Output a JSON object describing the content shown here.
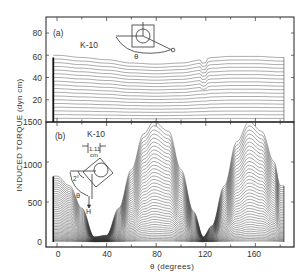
{
  "chart_data": [
    {
      "panel": "(a)",
      "type": "line",
      "sample": "K-10",
      "title": "",
      "xlabel": "θ (degrees)",
      "ylabel": "INDUCED TORQUE (dyn cm)",
      "xlim": [
        -5,
        185
      ],
      "ylim": [
        0,
        95
      ],
      "yticks": [
        20,
        40,
        60,
        80
      ],
      "xticks": [
        0,
        40,
        80,
        120,
        160
      ],
      "grid": false,
      "series_description": "Family of ~18 nearly flat curves; top curve ~60 at θ≈5, sagging to ~52 near θ≈60-90, rising back to ~58 beyond θ≈125 with a small glitch near θ≈120; lower curves evenly spaced down to ~4",
      "series": [
        {
          "name": "top curve",
          "x": [
            0,
            20,
            40,
            60,
            80,
            100,
            118,
            125,
            140,
            160,
            180
          ],
          "values": [
            60,
            58,
            56,
            53,
            52,
            53,
            56,
            58,
            59,
            59,
            58
          ]
        },
        {
          "name": "mid curve",
          "x": [
            0,
            40,
            80,
            120,
            180
          ],
          "values": [
            40,
            39,
            38,
            38,
            39
          ]
        },
        {
          "name": "low curve",
          "x": [
            0,
            40,
            80,
            120,
            180
          ],
          "values": [
            10,
            10,
            10,
            10,
            10
          ]
        }
      ]
    },
    {
      "panel": "(b)",
      "type": "line",
      "sample": "K-10",
      "xlabel": "θ (degrees)",
      "ylabel": "INDUCED TORQUE (dyn cm)",
      "xlim": [
        -5,
        185
      ],
      "ylim": [
        0,
        1550
      ],
      "yticks": [
        0,
        500,
        1000,
        1500
      ],
      "xticks": [
        0,
        40,
        80,
        120,
        160
      ],
      "grid": false,
      "series_description": "Family of ~40 curves with two-fold periodic shape; minima near θ≈30 and θ≈118, maxima near θ≈78 and θ≈155; top curve peaks ~1500",
      "series": [
        {
          "name": "top curve",
          "x": [
            0,
            10,
            20,
            30,
            40,
            50,
            60,
            70,
            78,
            90,
            100,
            110,
            118,
            125,
            135,
            145,
            155,
            165,
            175,
            180
          ],
          "values": [
            820,
            700,
            420,
            60,
            80,
            420,
            900,
            1350,
            1500,
            1380,
            900,
            380,
            60,
            200,
            700,
            1250,
            1500,
            1380,
            1000,
            700
          ]
        }
      ]
    }
  ],
  "labels": {
    "panel_a": "(a)",
    "panel_b": "(b)",
    "sample_a": "K-10",
    "sample_b": "K-10",
    "ylabel": "INDUCED TORQUE (dyn cm)",
    "xlabel": "θ  (degrees)",
    "inset_a_theta": "θ",
    "inset_b_theta": "θ",
    "inset_b_H": "H",
    "inset_b_angle": "2°",
    "inset_b_dim": "1.11",
    "inset_b_unit": "cm"
  },
  "ticks": {
    "a_y": [
      "80",
      "60",
      "40",
      "20"
    ],
    "b_y": [
      "1500",
      "1000",
      "500",
      "0"
    ],
    "x": [
      "0",
      "40",
      "80",
      "120",
      "160"
    ]
  }
}
